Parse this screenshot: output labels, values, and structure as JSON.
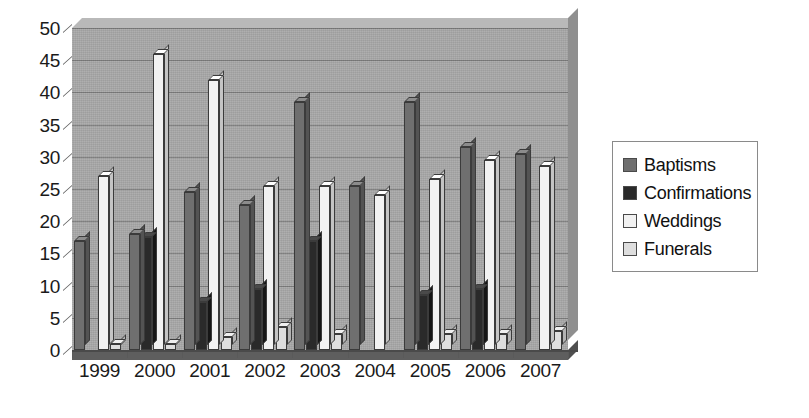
{
  "chart_data": {
    "type": "bar",
    "title": "",
    "xlabel": "",
    "ylabel": "",
    "categories": [
      "1999",
      "2000",
      "2001",
      "2002",
      "2003",
      "2004",
      "2005",
      "2006",
      "2007"
    ],
    "series": [
      {
        "name": "Baptisms",
        "color": "#6f6f6f",
        "values": [
          17,
          18,
          24.5,
          22.5,
          38.5,
          25.5,
          38.5,
          31.5,
          30.5
        ]
      },
      {
        "name": "Confirmations",
        "color": "#2a2a2a",
        "values": [
          0,
          17.5,
          7.5,
          9.5,
          17,
          0,
          8.5,
          9.5,
          0
        ]
      },
      {
        "name": "Weddings",
        "color": "#f2f2f2",
        "values": [
          27,
          46,
          42,
          25.5,
          25.5,
          24,
          26.5,
          29.5,
          28.5
        ]
      },
      {
        "name": "Funerals",
        "color": "#dedede",
        "values": [
          1,
          1,
          2,
          3.5,
          2.5,
          0,
          2.5,
          2.5,
          3
        ]
      }
    ],
    "ylim": [
      0,
      50
    ],
    "yticks": [
      0,
      5,
      10,
      15,
      20,
      25,
      30,
      35,
      40,
      45,
      50
    ],
    "grid": true,
    "legend_position": "right",
    "legend_entries": [
      "Baptisms",
      "Confirmations",
      "Weddings",
      "Funerals"
    ]
  }
}
